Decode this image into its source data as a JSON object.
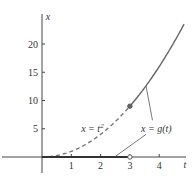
{
  "chart_data": {
    "type": "line",
    "title": "",
    "xlabel": "t",
    "ylabel": "x",
    "xlim": [
      0,
      4.8
    ],
    "ylim": [
      0,
      24
    ],
    "xticks": [
      "1",
      "2",
      "3",
      "4"
    ],
    "xtick_values": [
      1,
      2,
      3,
      4
    ],
    "yticks": [
      "5",
      "10",
      "15",
      "20"
    ],
    "ytick_values": [
      5,
      10,
      15,
      20
    ],
    "grid": false,
    "series": [
      {
        "name": "x = t^2 (dashed, t < 3)",
        "style": "dashed",
        "function": "t^2",
        "t_range": [
          0,
          3
        ]
      },
      {
        "name": "x = g(t) solid branch (t >= 3)",
        "style": "solid",
        "function": "t^2",
        "t_range": [
          3,
          4.85
        ]
      },
      {
        "name": "x = g(t) zero branch (0 <= t < 3)",
        "style": "solid-thick",
        "function": "0",
        "t_range": [
          0,
          3
        ]
      }
    ],
    "points": [
      {
        "name": "filled-point",
        "t": 3,
        "x": 9,
        "filled": true
      },
      {
        "name": "open-point",
        "t": 3,
        "x": 0,
        "filled": false
      }
    ],
    "annotations": [
      {
        "text_prefix": "x = t",
        "superscript": "2",
        "t": 1.2,
        "x": 5
      },
      {
        "text": "x = g(t)",
        "t": 3.8,
        "x": 5
      }
    ]
  }
}
